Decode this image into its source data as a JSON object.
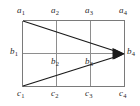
{
  "figure": {
    "background_color": "#ffffff",
    "grid_color": "#8e8e8e",
    "arrow_color": "#1a1a1a",
    "label_color": "#2b2b2b",
    "columns": 4,
    "rows": 3
  },
  "rows": {
    "top": {
      "name": "a",
      "labels": [
        {
          "id": "a1",
          "base": "a",
          "sub": "1"
        },
        {
          "id": "a2",
          "base": "a",
          "sub": "2"
        },
        {
          "id": "a3",
          "base": "a",
          "sub": "3"
        },
        {
          "id": "a4",
          "base": "a",
          "sub": "4"
        }
      ]
    },
    "middle": {
      "name": "b",
      "labels": [
        {
          "id": "b1",
          "base": "b",
          "sub": "1"
        },
        {
          "id": "b2",
          "base": "b",
          "sub": "2"
        },
        {
          "id": "b3",
          "base": "b",
          "sub": "3"
        },
        {
          "id": "b4",
          "base": "b",
          "sub": "4"
        }
      ]
    },
    "bottom": {
      "name": "c",
      "labels": [
        {
          "id": "c1",
          "base": "c",
          "sub": "1"
        },
        {
          "id": "c2",
          "base": "c",
          "sub": "2"
        },
        {
          "id": "c3",
          "base": "c",
          "sub": "3"
        },
        {
          "id": "c4",
          "base": "c",
          "sub": "4"
        }
      ]
    }
  },
  "arrows": [
    {
      "id": "arrow-a1-b4",
      "from": "a1",
      "to": "b4"
    },
    {
      "id": "arrow-c1-b4",
      "from": "c1",
      "to": "b4"
    }
  ]
}
